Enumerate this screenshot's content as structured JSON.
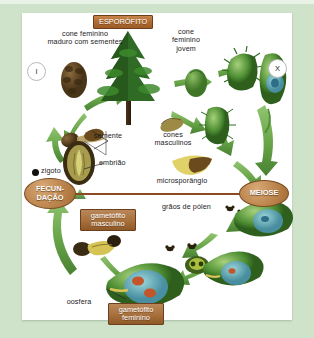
{
  "diagram": {
    "frame_color": "#cfe3ca",
    "panel_color": "#ffffff",
    "accent_brown": "#a06a33",
    "accent_green": "#5a9a3c"
  },
  "headers": {
    "sporophyte": "ESPORÓFITO"
  },
  "ploidy": {
    "left": "I",
    "right": "X"
  },
  "processes": {
    "fertilization": "FECUN-\nDAÇÃO",
    "meiosis": "MEIOSE"
  },
  "tags": {
    "male_gametophyte": "gametófito\nmasculino",
    "female_gametophyte": "gametófito\nfeminino"
  },
  "labels": {
    "mature_female_cone": "cone feminino\nmaduro com sementes",
    "young_female_cone": "cone\nfeminino\njovem",
    "seed": "semente",
    "embryo": "embrião",
    "zygote": "zigoto",
    "male_cones": "cones\nmasculinos",
    "microsporangium": "microsporângio",
    "pollen_grains": "grãos de pólen",
    "egg_cell": "oosfera"
  },
  "icons": {
    "tree": "conifer-tree-icon",
    "arrow": "green-arrow-icon",
    "zygote_dot": "zygote-dot-icon",
    "pollen": "pollen-grain-icon"
  }
}
